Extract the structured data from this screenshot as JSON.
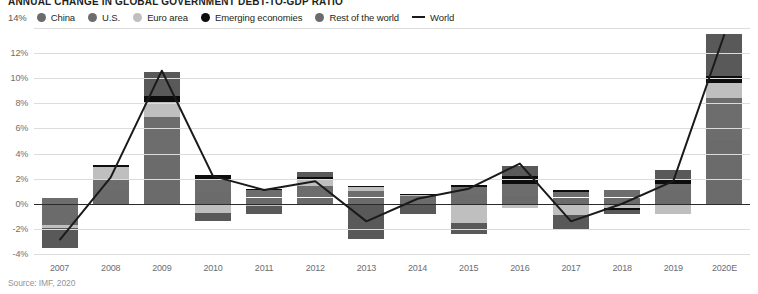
{
  "title": "ANNUAL CHANGE IN GLOBAL GOVERNMENT DEBT-TO-GDP RATIO",
  "source": "Source: IMF, 2020",
  "legend": {
    "axis_top_label": "14%",
    "items": [
      {
        "label": "China",
        "color": "#6b6b6b",
        "marker": "dot"
      },
      {
        "label": "U.S.",
        "color": "#6d6d6d",
        "marker": "dot"
      },
      {
        "label": "Euro area",
        "color": "#bfbfbf",
        "marker": "dot"
      },
      {
        "label": "Emerging economies",
        "color": "#0d0d0d",
        "marker": "dot"
      },
      {
        "label": "Rest of the world",
        "color": "#6b6b6b",
        "marker": "dot"
      },
      {
        "label": "World",
        "color": "#1a1a1a",
        "marker": "line"
      }
    ]
  },
  "chart_data": {
    "type": "bar",
    "title": "ANNUAL CHANGE IN GLOBAL GOVERNMENT DEBT-TO-GDP RATIO",
    "xlabel": "",
    "ylabel": "",
    "ylim": [
      -4,
      14
    ],
    "yticks": [
      "-4%",
      "-2%",
      "0%",
      "2%",
      "4%",
      "6%",
      "8%",
      "10%",
      "12%",
      "14%"
    ],
    "ytick_values": [
      -4,
      -2,
      0,
      2,
      4,
      6,
      8,
      10,
      12,
      14
    ],
    "grid": true,
    "stacked": true,
    "legend_position": "top",
    "categories": [
      "2007",
      "2008",
      "2009",
      "2010",
      "2011",
      "2012",
      "2013",
      "2014",
      "2015",
      "2016",
      "2017",
      "2018",
      "2019",
      "2020E"
    ],
    "series": [
      {
        "name": "China",
        "color": "#6b6b6b",
        "values": [
          -1.7,
          1.1,
          3.8,
          0.9,
          0.5,
          0.5,
          0.5,
          0.3,
          0.8,
          0.6,
          0.5,
          0.5,
          1.1,
          5.1
        ]
      },
      {
        "name": "U.S.",
        "color": "#6d6d6d",
        "values": [
          0.5,
          0.9,
          3.1,
          1.1,
          0.6,
          0.9,
          0.5,
          0.3,
          0.5,
          1.0,
          0.4,
          0.6,
          0.5,
          3.3
        ]
      },
      {
        "name": "Euro area",
        "color": "#bfbfbf",
        "values": [
          -0.2,
          0.9,
          1.2,
          -0.7,
          -0.2,
          0.6,
          0.3,
          0.1,
          -1.5,
          -0.3,
          -0.9,
          -0.3,
          -0.8,
          1.2
        ]
      },
      {
        "name": "Emerging economies",
        "color": "#0d0d0d",
        "values": [
          0.0,
          0.2,
          0.5,
          0.3,
          0.1,
          0.1,
          0.1,
          0.1,
          0.2,
          0.6,
          0.2,
          -0.2,
          0.3,
          0.6
        ]
      },
      {
        "name": "Rest of the world",
        "color": "#595959",
        "values": [
          -1.6,
          0.0,
          1.9,
          -0.7,
          -0.6,
          0.4,
          -2.8,
          -0.8,
          -0.9,
          0.8,
          -1.1,
          -0.3,
          0.8,
          3.3
        ]
      }
    ],
    "world_line": {
      "name": "World",
      "color": "#1a1a1a",
      "values": [
        -2.9,
        2.1,
        10.6,
        2.2,
        1.1,
        1.8,
        -1.4,
        0.4,
        1.2,
        3.2,
        -1.4,
        0.0,
        1.8,
        13.5
      ]
    }
  }
}
